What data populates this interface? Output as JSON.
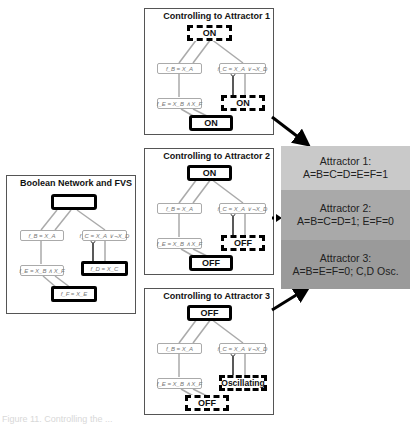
{
  "panels": {
    "network": {
      "title": "Boolean Network and FVS",
      "top_node": "",
      "fns": {
        "b": "f_B = X_A",
        "c": "f_C = X_A ∨ ¬X_D",
        "e": "f_E = X_B ∧ X_F",
        "d": "f_D = X_C",
        "f": "f_F = X_E"
      }
    },
    "attractor1": {
      "title": "Controlling to Attractor 1",
      "top_node": "ON",
      "fns": {
        "b": "f_B = X_A",
        "c": "f_C = X_A ∨ ¬X_D",
        "e": "f_E = X_B ∧ X_F"
      },
      "d_node": "ON",
      "f_node": "ON"
    },
    "attractor2": {
      "title": "Controlling to Attractor 2",
      "top_node": "ON",
      "fns": {
        "b": "f_B = X_A",
        "c": "f_C = X_A ∨ ¬X_D",
        "e": "f_E = X_B ∧ X_F"
      },
      "d_node": "OFF",
      "f_node": "OFF"
    },
    "attractor3": {
      "title": "Controlling to Attractor 3",
      "top_node": "OFF",
      "fns": {
        "b": "f_B = X_A",
        "c": "f_C = X_A ∨ ¬X_D",
        "e": "f_E = X_B ∧ X_F"
      },
      "d_node": "Oscillating",
      "f_node": "OFF"
    }
  },
  "attractors": [
    {
      "label": "Attractor 1:",
      "state": "A=B=C=D=E=F=1",
      "color": "#c9c9c9"
    },
    {
      "label": "Attractor 2:",
      "state": "A=B=C=D=1; E=F=0",
      "color": "#a9a9a9"
    },
    {
      "label": "Attractor 3:",
      "state": "A=B=E=F=0; C,D Osc.",
      "color": "#9a9a9a"
    }
  ],
  "caption": "Figure 11. Controlling the ..."
}
